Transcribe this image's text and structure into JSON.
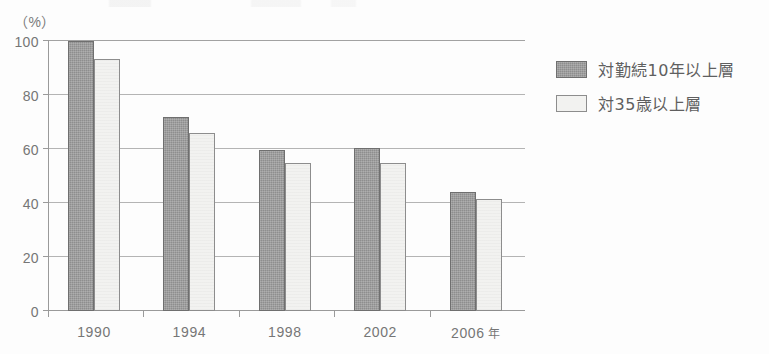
{
  "chart_data": {
    "type": "bar",
    "title": "",
    "subtitle": "",
    "xlabel": "",
    "ylabel": "",
    "y_unit_label": "（%）",
    "categories": [
      "1990",
      "1994",
      "1998",
      "2002",
      "2006"
    ],
    "x_axis_last_suffix": "年",
    "ylim": [
      0,
      100
    ],
    "y_ticks": [
      "0",
      "20",
      "40",
      "60",
      "80",
      "100"
    ],
    "y_tick_values": [
      0,
      20,
      40,
      60,
      80,
      100
    ],
    "grid": "horizontal",
    "legend_position": "right",
    "series": [
      {
        "name": "対勤続10年以上層",
        "color": "#8e8e8e",
        "swatch": "dark",
        "values": [
          100,
          72,
          59.5,
          60.5,
          44
        ]
      },
      {
        "name": "対35歳以上層",
        "color": "#f2f2f0",
        "swatch": "light",
        "values": [
          93.5,
          66,
          55,
          55,
          41.5
        ]
      }
    ]
  },
  "colors": {
    "series_dark": "#8e8e8e",
    "series_light": "#f2f2f0",
    "axis": "#9a9a9a",
    "gridline": "#b4b4b4",
    "text": "#6b6b6b",
    "background": "#fdfdfd"
  }
}
